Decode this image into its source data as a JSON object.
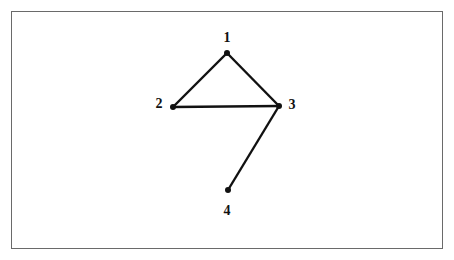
{
  "diagram": {
    "type": "graph",
    "nodes": [
      {
        "id": "1",
        "label": "1",
        "x": 227,
        "y": 53,
        "lx": 227,
        "ly": 38
      },
      {
        "id": "2",
        "label": "2",
        "x": 173,
        "y": 107,
        "lx": 159,
        "ly": 104
      },
      {
        "id": "3",
        "label": "3",
        "x": 279,
        "y": 106,
        "lx": 292,
        "ly": 105
      },
      {
        "id": "4",
        "label": "4",
        "x": 228,
        "y": 190,
        "lx": 227,
        "ly": 211
      }
    ],
    "edges": [
      {
        "from": "1",
        "to": "2"
      },
      {
        "from": "1",
        "to": "3"
      },
      {
        "from": "2",
        "to": "3"
      },
      {
        "from": "3",
        "to": "4"
      }
    ],
    "colors": {
      "line": "#111111",
      "frame": "#6a6a6a"
    }
  }
}
